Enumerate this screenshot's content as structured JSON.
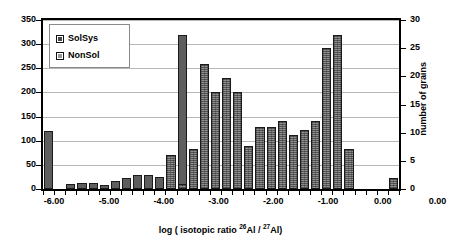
{
  "chart_data": {
    "type": "bar",
    "title": "",
    "xlabel": "log ( isotopic ratio 26Al / 27Al)",
    "ylabel": "",
    "ylabel_right": "number of grains",
    "ylim": [
      0,
      350
    ],
    "ylim_right": [
      0,
      30
    ],
    "grid": true,
    "legend_position": "top-left",
    "y_ticks_left": [
      "350",
      "300",
      "250",
      "200",
      "150",
      "100",
      "50",
      "0"
    ],
    "y_ticks_right": [
      "30",
      "25",
      "20",
      "15",
      "10",
      "5",
      "0"
    ],
    "x_ticks": [
      "-6.00",
      "-5.00",
      "-4.00",
      "-3.00",
      "-2.00",
      "-1.00",
      "0.00",
      "0.00"
    ],
    "x_range": [
      -6.25,
      0.25
    ],
    "bin_width": 0.203125,
    "series": [
      {
        "name": "SolSys",
        "fill": "solid",
        "color": "#5e5e5e",
        "values": [
          120,
          0,
          10,
          13,
          12,
          8,
          17,
          22,
          28,
          30,
          25,
          0,
          320,
          0,
          0,
          0,
          0,
          0,
          0,
          0,
          0,
          0,
          0,
          0,
          0,
          0,
          0,
          0,
          0,
          0,
          0,
          0
        ]
      },
      {
        "name": "NonSol",
        "fill": "hatched",
        "color": "#8f8f8f",
        "values": [
          0,
          0,
          0,
          0,
          0,
          0,
          0,
          0,
          0,
          0,
          0,
          70,
          10,
          82,
          258,
          200,
          230,
          200,
          90,
          128,
          128,
          140,
          112,
          122,
          140,
          293,
          320,
          82,
          0,
          0,
          0,
          22
        ]
      }
    ],
    "bins": [
      {
        "index": 0,
        "series": "SolSys",
        "value": 120
      },
      {
        "index": 2,
        "series": "SolSys",
        "value": 10
      },
      {
        "index": 3,
        "series": "SolSys",
        "value": 13
      },
      {
        "index": 4,
        "series": "SolSys",
        "value": 12
      },
      {
        "index": 5,
        "series": "SolSys",
        "value": 8
      },
      {
        "index": 6,
        "series": "SolSys",
        "value": 17
      },
      {
        "index": 7,
        "series": "SolSys",
        "value": 22
      },
      {
        "index": 8,
        "series": "SolSys",
        "value": 28
      },
      {
        "index": 9,
        "series": "SolSys",
        "value": 30
      },
      {
        "index": 10,
        "series": "SolSys",
        "value": 25
      },
      {
        "index": 11,
        "series": "NonSol",
        "value": 70
      },
      {
        "index": 12,
        "series": "SolSys",
        "value": 320
      },
      {
        "index": 12,
        "series": "NonSol",
        "value": 10
      },
      {
        "index": 13,
        "series": "NonSol",
        "value": 82
      },
      {
        "index": 14,
        "series": "NonSol",
        "value": 258
      },
      {
        "index": 15,
        "series": "NonSol",
        "value": 200
      },
      {
        "index": 16,
        "series": "NonSol",
        "value": 230
      },
      {
        "index": 17,
        "series": "NonSol",
        "value": 200
      },
      {
        "index": 18,
        "series": "NonSol",
        "value": 90
      },
      {
        "index": 19,
        "series": "NonSol",
        "value": 128
      },
      {
        "index": 20,
        "series": "NonSol",
        "value": 128
      },
      {
        "index": 21,
        "series": "NonSol",
        "value": 140
      },
      {
        "index": 22,
        "series": "NonSol",
        "value": 112
      },
      {
        "index": 23,
        "series": "NonSol",
        "value": 122
      },
      {
        "index": 24,
        "series": "NonSol",
        "value": 140
      },
      {
        "index": 25,
        "series": "NonSol",
        "value": 293
      },
      {
        "index": 26,
        "series": "NonSol",
        "value": 320
      },
      {
        "index": 27,
        "series": "NonSol",
        "value": 82
      },
      {
        "index": 31,
        "series": "NonSol",
        "value": 22
      }
    ]
  },
  "legend": {
    "items": [
      {
        "label": "SolSys"
      },
      {
        "label": "NonSol"
      }
    ]
  },
  "axis": {
    "x_title_prefix": "log ( isotopic ratio ",
    "x_title_sup1": "26",
    "x_title_mid1": "Al / ",
    "x_title_sup2": "27",
    "x_title_suffix": "Al)",
    "y_right_title": "number of grains"
  }
}
